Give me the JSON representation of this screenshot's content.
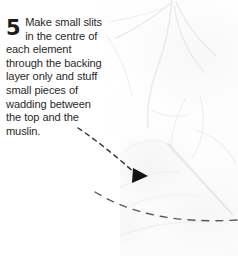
{
  "page": {
    "width": 238,
    "height": 256,
    "background_color": "#ffffff",
    "kind": "instructional craft step panel"
  },
  "caption": {
    "step_number": "5",
    "text": "Make small slits in the centre of each element through the backing layer only and stuff small pieces of wadding between the top and the muslin.",
    "lines": [
      "Make small",
      "slits in the",
      "centre of each",
      "element through",
      "the backing layer",
      "only and stuff small",
      "pieces of wadding",
      "between the top",
      "and the muslin."
    ],
    "text_color": "#2a2a2a",
    "step_number_color": "#1b1b1b"
  },
  "photo": {
    "subject": "white quilted muslin fabric with stuffed elements",
    "description": "very pale white-on-white photograph of trapunto quilting showing stitched seam lines, soft fabric folds and a slim tool laid diagonally across the lower right",
    "tone": "high-key white",
    "base_color": "#fafafa",
    "shadow_color": "#e8e8e8"
  },
  "annotations": {
    "arrow": {
      "name": "dashed-pointer-arrow",
      "style": "dashed",
      "color": "#333333",
      "start": {
        "x": 78,
        "y": 128
      },
      "end": {
        "x": 143,
        "y": 176
      },
      "head": "filled-triangle-right",
      "meaning": "points to the slit in the backing layer"
    },
    "curve": {
      "name": "dashed-guide-curve",
      "style": "dashed",
      "color": "#4a4a4a",
      "start": {
        "x": 95,
        "y": 193
      },
      "end": {
        "x": 238,
        "y": 222
      },
      "meaning": "traces the outline of the quilted element along the lower edge"
    }
  }
}
